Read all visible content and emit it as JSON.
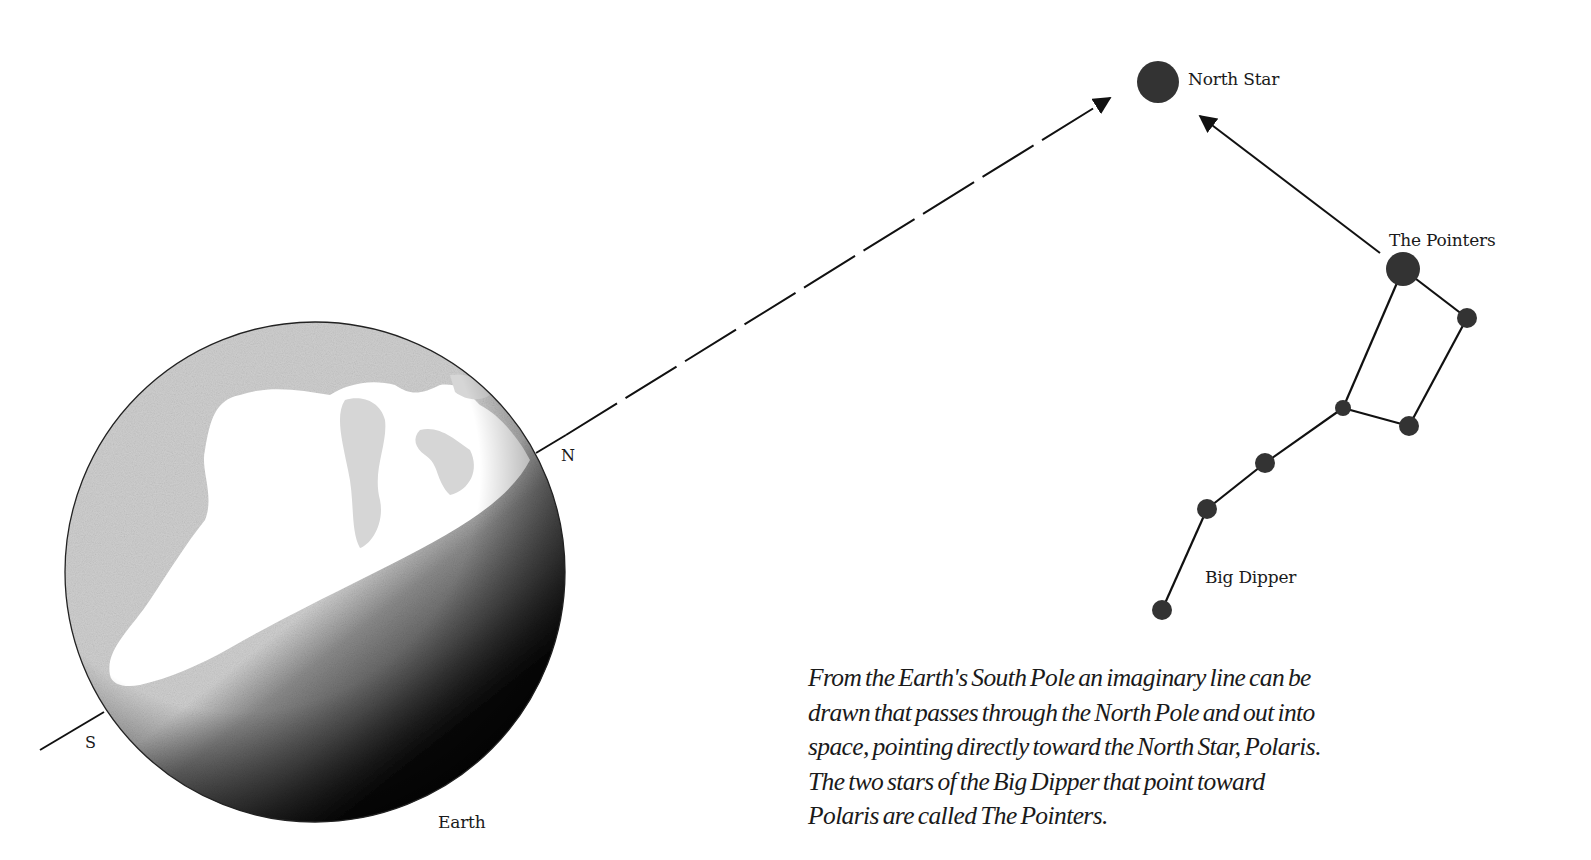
{
  "labels": {
    "north_star": "North Star",
    "the_pointers": "The Pointers",
    "big_dipper": "Big Dipper",
    "earth": "Earth",
    "north_pole": "N",
    "south_pole": "S"
  },
  "caption": {
    "lines": [
      "From the Earth's South Pole an imaginary line can be",
      "drawn that passes through the North Pole and out into",
      "space, pointing directly toward the North Star, Polaris.",
      "The two stars of the Big Dipper that point toward",
      "Polaris are called The Pointers."
    ]
  },
  "colors": {
    "background": "#ffffff",
    "ink": "#1a1a1a",
    "star": "#333333",
    "globe_light": "#d9d9d9",
    "globe_dark": "#000000"
  },
  "diagram": {
    "north_star": {
      "cx": 1158,
      "cy": 82,
      "r": 21
    },
    "earth": {
      "cx": 315,
      "cy": 572,
      "r": 250
    },
    "axis": {
      "south_end": [
        40,
        750
      ],
      "north_pole": [
        536,
        453
      ],
      "arrow_tip": [
        1112,
        97
      ]
    },
    "big_dipper_stars": [
      {
        "name": "pointer-1",
        "cx": 1403,
        "cy": 269,
        "r": 17
      },
      {
        "name": "pointer-2",
        "cx": 1467,
        "cy": 318,
        "r": 10
      },
      {
        "name": "bowl-3",
        "cx": 1409,
        "cy": 426,
        "r": 10
      },
      {
        "name": "bowl-4",
        "cx": 1343,
        "cy": 408,
        "r": 8
      },
      {
        "name": "handle-5",
        "cx": 1265,
        "cy": 463,
        "r": 10
      },
      {
        "name": "handle-6",
        "cx": 1207,
        "cy": 509,
        "r": 10
      },
      {
        "name": "handle-7",
        "cx": 1162,
        "cy": 610,
        "r": 10
      }
    ]
  }
}
